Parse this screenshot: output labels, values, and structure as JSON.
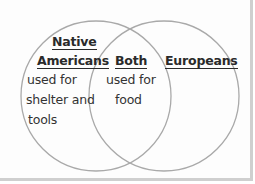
{
  "diagram": {
    "type": "venn",
    "circles": [
      {
        "id": "left",
        "heading_lines": [
          "Native",
          "Americans"
        ],
        "items_lines": [
          "used for",
          "shelter and",
          "tools"
        ]
      },
      {
        "id": "overlap",
        "heading_lines": [
          "Both"
        ],
        "items_lines": [
          "used for",
          "food"
        ]
      },
      {
        "id": "right",
        "heading_lines": [
          "Europeans"
        ],
        "items_lines": []
      }
    ],
    "colors": {
      "circle_stroke": "#a9a9a9",
      "text": "#2a2a2a",
      "background": "#fdfdfd",
      "frame_border": "#cfcfcf"
    }
  }
}
